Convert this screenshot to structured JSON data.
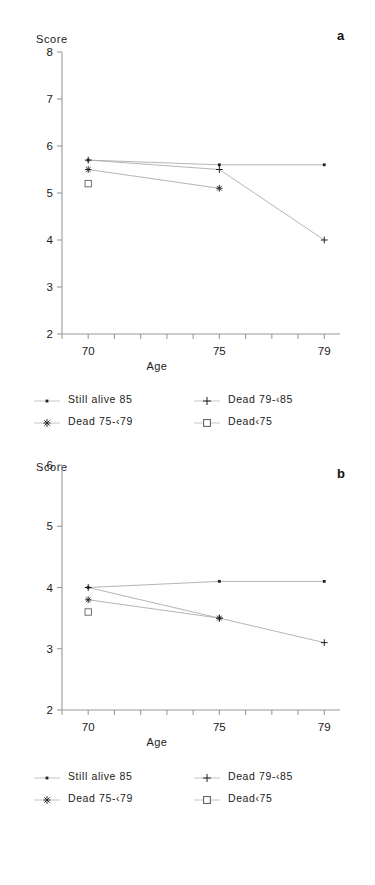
{
  "figure": {
    "panels": [
      {
        "letter": "a",
        "y_axis_label": "Score",
        "x_axis_label": "Age"
      },
      {
        "letter": "b",
        "y_axis_label": "Score",
        "x_axis_label": "Age"
      }
    ],
    "legend_entries": [
      {
        "label": "Still alive 85",
        "marker": "dot-icon"
      },
      {
        "label": "Dead 79-‹85",
        "marker": "plus-icon"
      },
      {
        "label": "Dead 75-‹79",
        "marker": "asterisk-icon"
      },
      {
        "label": "Dead‹75",
        "marker": "square-icon"
      }
    ]
  },
  "chart_data": [
    {
      "type": "line",
      "panel": "a",
      "title": "",
      "xlabel": "Age",
      "ylabel": "Score",
      "x": [
        70,
        75,
        79
      ],
      "xticklabels": [
        "70",
        "75",
        "79"
      ],
      "xlim": [
        69,
        79.6
      ],
      "ylim": [
        2,
        8
      ],
      "yticks": [
        2,
        3,
        4,
        5,
        6,
        7,
        8
      ],
      "yticklabels": [
        "2",
        "3",
        "4",
        "5",
        "6",
        "7",
        "8"
      ],
      "grid": false,
      "legend_position": "below-plot",
      "series": [
        {
          "name": "Still alive 85",
          "marker": "dot",
          "x": [
            70,
            75,
            79
          ],
          "values": [
            5.7,
            5.6,
            5.6
          ]
        },
        {
          "name": "Dead 79-<85",
          "marker": "plus",
          "x": [
            70,
            75,
            79
          ],
          "values": [
            5.7,
            5.5,
            4.0
          ]
        },
        {
          "name": "Dead 75-<79",
          "marker": "asterisk",
          "x": [
            70,
            75
          ],
          "values": [
            5.5,
            5.1
          ]
        },
        {
          "name": "Dead<75",
          "marker": "square",
          "x": [
            70
          ],
          "values": [
            5.2
          ]
        }
      ]
    },
    {
      "type": "line",
      "panel": "b",
      "title": "",
      "xlabel": "Age",
      "ylabel": "Score",
      "x": [
        70,
        75,
        79
      ],
      "xticklabels": [
        "70",
        "75",
        "79"
      ],
      "xlim": [
        69,
        79.6
      ],
      "ylim": [
        2,
        6
      ],
      "yticks": [
        2,
        3,
        4,
        5,
        6
      ],
      "yticklabels": [
        "2",
        "3",
        "4",
        "5",
        "6"
      ],
      "grid": false,
      "legend_position": "below-plot",
      "series": [
        {
          "name": "Still alive 85",
          "marker": "dot",
          "x": [
            70,
            75,
            79
          ],
          "values": [
            4.0,
            4.1,
            4.1
          ]
        },
        {
          "name": "Dead 79-<85",
          "marker": "plus",
          "x": [
            70,
            75,
            79
          ],
          "values": [
            4.0,
            3.5,
            3.1
          ]
        },
        {
          "name": "Dead 75-<79",
          "marker": "asterisk",
          "x": [
            70,
            75
          ],
          "values": [
            3.8,
            3.5
          ]
        },
        {
          "name": "Dead<75",
          "marker": "square",
          "x": [
            70
          ],
          "values": [
            3.6
          ]
        }
      ]
    }
  ]
}
